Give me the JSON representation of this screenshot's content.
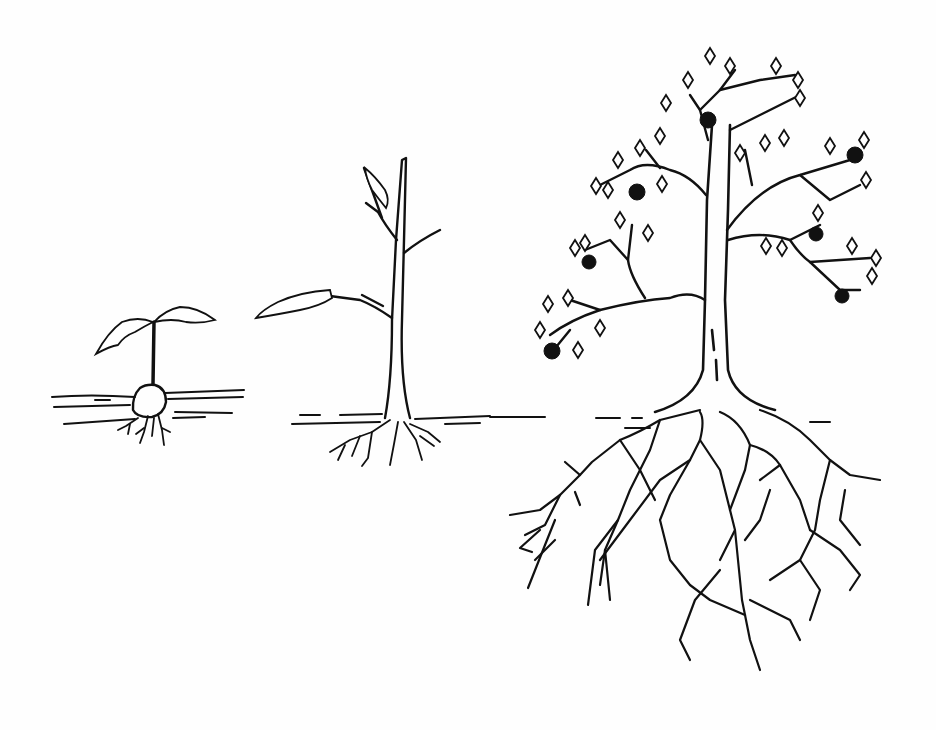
{
  "illustration": {
    "subject": "Plant growth stages",
    "style": "black ink line drawing",
    "background_color": "#fefefe",
    "ink_color": "#111111",
    "stages": [
      {
        "name": "seedling",
        "description": "Seed with sprout, two leaves, small roots"
      },
      {
        "name": "sapling",
        "description": "Young thin tree with few branches and a leaf, small root system"
      },
      {
        "name": "mature-tree",
        "description": "Full tree with many leaves and fruits, large spreading root system"
      }
    ]
  }
}
